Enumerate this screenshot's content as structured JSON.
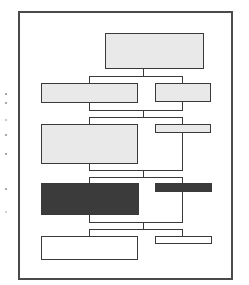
{
  "diagram": {
    "type": "tree/flow chart thumbnail (no text)",
    "frame": {
      "x": 18,
      "y": 11,
      "w": 215,
      "h": 269
    },
    "colors": {
      "frame": "#4a4a4a",
      "line": "#3a3a3a",
      "light_fill": "#e9e9e9",
      "dark_fill": "#3b3b3b",
      "white_fill": "#ffffff"
    },
    "nodes": [
      {
        "id": "root",
        "x": 105,
        "y": 33,
        "w": 99,
        "h": 36,
        "fill": "light"
      },
      {
        "id": "l2-left",
        "x": 41,
        "y": 83,
        "w": 97,
        "h": 20,
        "fill": "light"
      },
      {
        "id": "l2-right",
        "x": 155,
        "y": 83,
        "w": 56,
        "h": 19,
        "fill": "light"
      },
      {
        "id": "l3-left",
        "x": 41,
        "y": 124,
        "w": 97,
        "h": 40,
        "fill": "light"
      },
      {
        "id": "l3-right",
        "x": 155,
        "y": 124,
        "w": 56,
        "h": 9,
        "fill": "light"
      },
      {
        "id": "l4-left",
        "x": 41,
        "y": 183,
        "w": 98,
        "h": 32,
        "fill": "dark"
      },
      {
        "id": "l4-right",
        "x": 155,
        "y": 183,
        "w": 57,
        "h": 9,
        "fill": "dark"
      },
      {
        "id": "l5-left",
        "x": 41,
        "y": 236,
        "w": 97,
        "h": 24,
        "fill": "white"
      },
      {
        "id": "l5-right",
        "x": 155,
        "y": 236,
        "w": 57,
        "h": 8,
        "fill": "white"
      }
    ],
    "brackets": [
      {
        "top": 76,
        "bottom": 110,
        "stem_from": 69
      },
      {
        "top": 117,
        "bottom": 170,
        "stem_from": 110
      },
      {
        "top": 177,
        "bottom": 222,
        "stem_from": 170
      },
      {
        "top": 229,
        "bottom": null,
        "stem_from": 222
      }
    ],
    "bracket_x": {
      "left": 89,
      "right": 182,
      "stem": 143
    },
    "margin_marks_y": [
      93,
      102,
      119,
      134,
      153,
      188,
      211
    ]
  }
}
